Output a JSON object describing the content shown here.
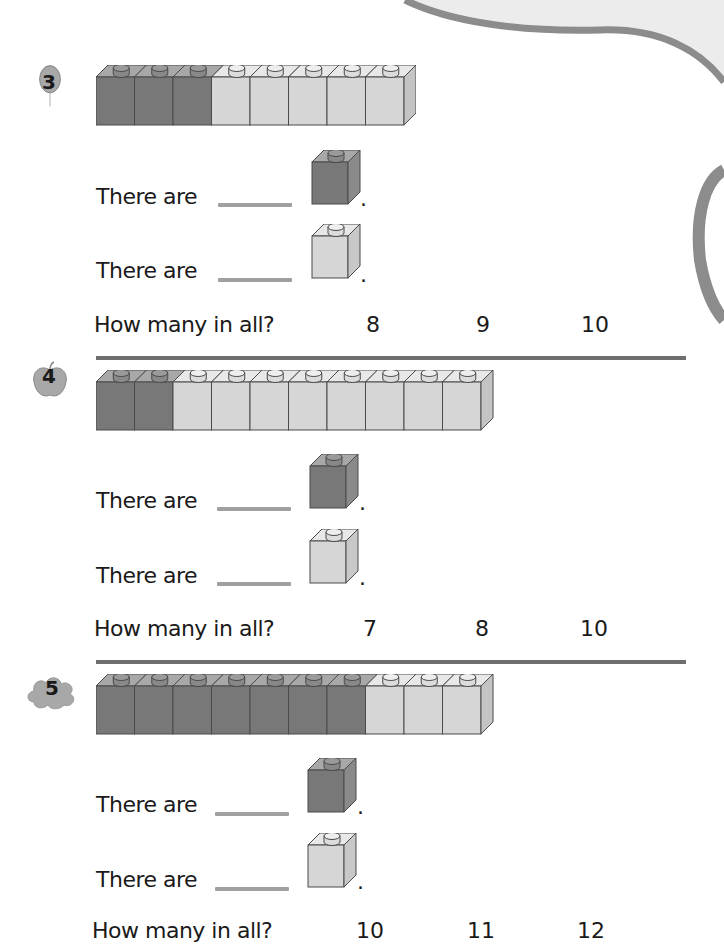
{
  "colors": {
    "dark_cube": "#787878",
    "dark_cube_top": "#a8a8a8",
    "light_cube": "#d6d6d6",
    "light_cube_top": "#e8e8e8",
    "cube_stroke": "#4a4a4a",
    "answer_line": "#a0a0a0",
    "divider": "#6e6e6e",
    "badge": "#b0b0b0"
  },
  "problems": [
    {
      "number": "3",
      "badge_shape": "balloon",
      "dark_count": 3,
      "light_count": 5,
      "prompt_dark": "There are",
      "prompt_light": "There are",
      "question": "How many in all?",
      "choices": [
        "8",
        "9",
        "10"
      ]
    },
    {
      "number": "4",
      "badge_shape": "apple",
      "dark_count": 2,
      "light_count": 8,
      "prompt_dark": "There are",
      "prompt_light": "There are",
      "question": "How many in all?",
      "choices": [
        "7",
        "8",
        "10"
      ]
    },
    {
      "number": "5",
      "badge_shape": "cloud",
      "dark_count": 7,
      "light_count": 3,
      "prompt_dark": "There are",
      "prompt_light": "There are",
      "question": "How many in all?",
      "choices": [
        "10",
        "11",
        "12"
      ]
    }
  ],
  "punctuation": "."
}
